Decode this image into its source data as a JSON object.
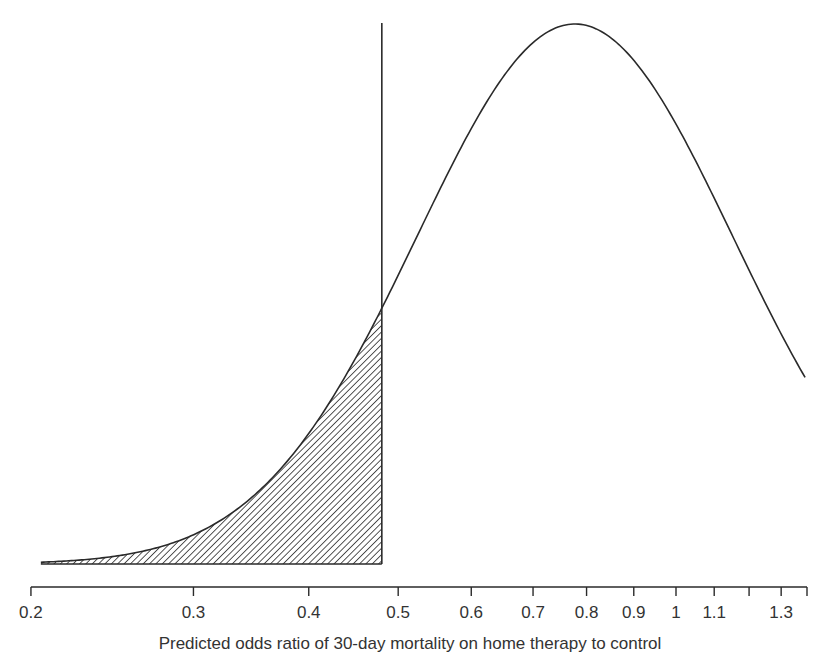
{
  "chart_data": {
    "type": "line",
    "title": "",
    "xlabel": "Predicted odds ratio of 30-day mortality on home therapy to control",
    "ylabel": "",
    "x_scale": "log",
    "xlim": [
      0.2,
      1.38
    ],
    "x_ticks": [
      {
        "value": 0.2,
        "label": "0.2"
      },
      {
        "value": 0.3,
        "label": "0.3"
      },
      {
        "value": 0.4,
        "label": "0.4"
      },
      {
        "value": 0.5,
        "label": "0.5"
      },
      {
        "value": 0.6,
        "label": "0.6"
      },
      {
        "value": 0.7,
        "label": "0.7"
      },
      {
        "value": 0.8,
        "label": "0.8"
      },
      {
        "value": 0.9,
        "label": "0.9"
      },
      {
        "value": 1.0,
        "label": "1"
      },
      {
        "value": 1.1,
        "label": "1.1"
      },
      {
        "value": 1.2,
        "label": ""
      },
      {
        "value": 1.3,
        "label": "1.3"
      }
    ],
    "y_axis_shown": false,
    "grid": false,
    "series": [
      {
        "name": "Predicted distribution of odds ratio",
        "distribution": "lognormal",
        "mode_odds_ratio": 0.777,
        "log_sd": 0.394,
        "x": [
          0.2,
          0.25,
          0.3,
          0.35,
          0.4,
          0.45,
          0.48,
          0.55,
          0.6,
          0.7,
          0.777,
          0.9,
          1.0,
          1.1,
          1.2,
          1.3,
          1.38
        ],
        "relative_density": [
          0.003,
          0.02,
          0.07,
          0.16,
          0.28,
          0.41,
          0.48,
          0.66,
          0.77,
          0.93,
          1.0,
          0.94,
          0.83,
          0.7,
          0.57,
          0.45,
          0.34
        ]
      }
    ],
    "reference_line": {
      "x": 0.48,
      "style": "vertical solid"
    },
    "shaded_region": {
      "from": 0.2,
      "to": 0.48,
      "pattern": "diagonal hatch",
      "description": "Left tail area below threshold"
    },
    "colors": {
      "line": "#2a2a2a",
      "hatch": "#2a2a2a",
      "background": "#ffffff"
    }
  }
}
